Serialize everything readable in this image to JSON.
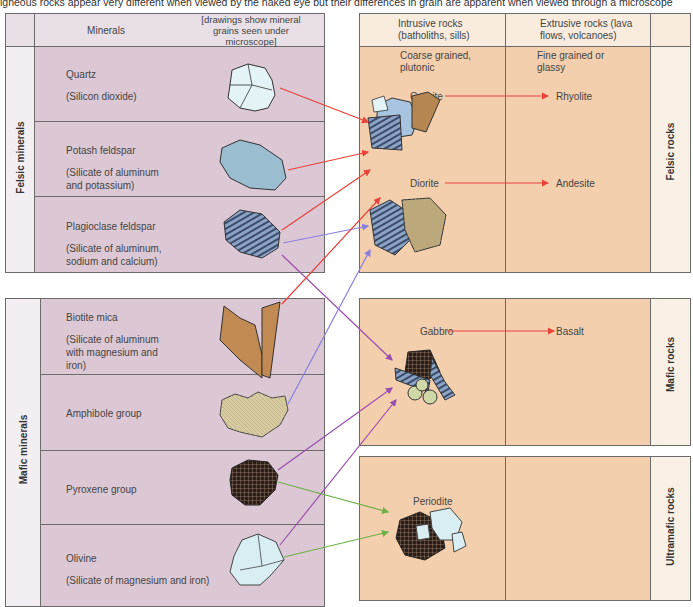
{
  "caption": "igneous rocks appear very different when viewed by the naked eye but their differences in grain are apparent when viewed through a microscope",
  "left_table": {
    "header": {
      "minerals_label": "Minerals",
      "drawings_label": "[drawings show mineral grains seen under microscope]"
    },
    "groups": [
      {
        "label": "Felsic minerals",
        "minerals": [
          {
            "name": "Quartz",
            "description": "(Silicon dioxide)",
            "icon": "quartz-grain-icon"
          },
          {
            "name": "Potash feldspar",
            "description": "(Silicate of aluminum and potassium)",
            "icon": "potash-feldspar-grain-icon"
          },
          {
            "name": "Plagioclase feldspar",
            "description": "(Silicate of aluminum, sodium and calcium)",
            "icon": "plagioclase-grain-icon"
          }
        ]
      },
      {
        "label": "Mafic minerals",
        "minerals": [
          {
            "name": "Biotite mica",
            "description": "(Silicate of aluminum with magnesium and iron)",
            "icon": "biotite-grain-icon"
          },
          {
            "name": "Amphibole group",
            "description": "",
            "icon": "amphibole-grain-icon"
          },
          {
            "name": "Pyroxene group",
            "description": "",
            "icon": "pyroxene-grain-icon"
          },
          {
            "name": "Olivine",
            "description": "(Silicate of magnesium and iron)",
            "icon": "olivine-grain-icon"
          }
        ]
      }
    ]
  },
  "right_table": {
    "header": {
      "intrusive": "Intrusive rocks (batholiths, sills)",
      "extrusive": "Extrusive rocks (lava flows, volcanoes)"
    },
    "subheader": {
      "intrusive": "Coarse grained, plutonic",
      "extrusive": "Fine grained or glassy"
    },
    "groups": [
      {
        "label": "Felsic rocks",
        "rows": [
          {
            "intrusive": "Granite",
            "extrusive": "Rhyolite"
          },
          {
            "intrusive": "Diorite",
            "extrusive": "Andesite"
          }
        ]
      },
      {
        "label": "Mafic rocks",
        "rows": [
          {
            "intrusive": "Gabbro",
            "extrusive": "Basalt"
          }
        ]
      },
      {
        "label": "Ultramafic rocks",
        "rows": [
          {
            "intrusive": "Periodite",
            "extrusive": ""
          }
        ]
      }
    ]
  },
  "colors": {
    "mineral_bg": "#dcc8d4",
    "rock_bg": "#f4cfae",
    "arrow_red": "#e8423a",
    "arrow_purple": "#9b4fb0",
    "arrow_violet": "#8a7fe0",
    "arrow_green": "#6fb04a"
  }
}
